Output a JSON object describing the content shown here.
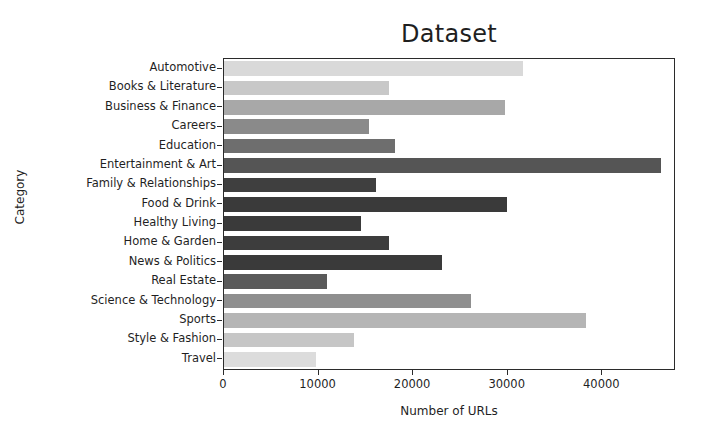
{
  "chart_data": {
    "type": "bar",
    "orientation": "horizontal",
    "title": "Dataset",
    "xlabel": "Number of URLs",
    "ylabel": "Category",
    "categories": [
      "Automotive",
      "Books & Literature",
      "Business & Finance",
      "Careers",
      "Education",
      "Entertainment & Art",
      "Family & Relationships",
      "Food & Drink",
      "Healthy Living",
      "Home & Garden",
      "News & Politics",
      "Real Estate",
      "Science & Technology",
      "Sports",
      "Style & Fashion",
      "Travel"
    ],
    "values": [
      31600,
      17400,
      29700,
      15300,
      18100,
      46200,
      16100,
      29900,
      14500,
      17400,
      23000,
      10900,
      26100,
      38300,
      13700,
      9700
    ],
    "bar_colors": [
      "#d9d9d9",
      "#c8c8c8",
      "#a8a8a8",
      "#8a8a8a",
      "#6e6e6e",
      "#555555",
      "#3f3f3f",
      "#3a3a3a",
      "#3a3a3a",
      "#3d3d3d",
      "#3a3a3a",
      "#5a5a5a",
      "#8f8f8f",
      "#b5b5b5",
      "#c6c6c6",
      "#dcdcdc"
    ],
    "xticks": [
      0,
      10000,
      20000,
      30000,
      40000
    ],
    "xtick_labels": [
      "0",
      "10000",
      "20000",
      "30000",
      "40000"
    ],
    "xlim": [
      0,
      47580
    ],
    "grid": false,
    "legend": null,
    "background": "#ffffff",
    "axis_color": "#2b2b2b"
  }
}
